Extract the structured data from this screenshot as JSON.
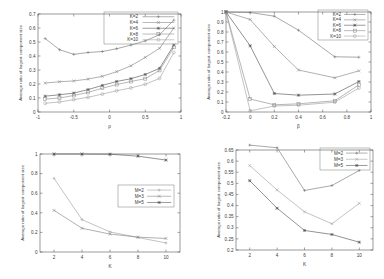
{
  "figure": {
    "background": "#ffffff",
    "panel_count": 4,
    "axis_color": "#4a4a4a"
  },
  "chart_data": [
    {
      "id": "top-left",
      "type": "line",
      "title": "",
      "xlabel": "ρ",
      "ylabel": "Average ratio of largest component size",
      "xlim": [
        -1,
        1
      ],
      "ylim": [
        0,
        0.7
      ],
      "xticks": [
        -1,
        -0.5,
        0,
        0.5,
        1
      ],
      "xticklabels": [
        "-1",
        "-0.5",
        "0",
        "0.5",
        "1"
      ],
      "yticks": [
        0,
        0.1,
        0.2,
        0.3,
        0.4,
        0.5,
        0.6,
        0.7
      ],
      "yticklabels": [
        "0",
        "0.1",
        "0.2",
        "0.3",
        "0.4",
        "0.5",
        "0.6",
        "0.7"
      ],
      "grid": false,
      "legend_position": "top-right",
      "x": [
        -0.9,
        -0.7,
        -0.5,
        -0.3,
        -0.1,
        0.1,
        0.3,
        0.5,
        0.7,
        0.9
      ],
      "series": [
        {
          "name": "K=2",
          "color": "#6f6f6f",
          "marker": "plus",
          "values": [
            0.525,
            0.445,
            0.412,
            0.425,
            0.432,
            0.452,
            0.478,
            0.508,
            0.552,
            0.657
          ]
        },
        {
          "name": "K=4",
          "color": "#7c7c7c",
          "marker": "cross",
          "values": [
            0.207,
            0.216,
            0.222,
            0.235,
            0.255,
            0.288,
            0.33,
            0.39,
            0.455,
            0.6
          ]
        },
        {
          "name": "K=6",
          "color": "#4a4a4a",
          "marker": "star",
          "values": [
            0.113,
            0.123,
            0.135,
            0.16,
            0.19,
            0.218,
            0.238,
            0.268,
            0.312,
            0.478
          ]
        },
        {
          "name": "K=8",
          "color": "#868686",
          "marker": "square",
          "values": [
            0.092,
            0.1,
            0.118,
            0.14,
            0.17,
            0.196,
            0.218,
            0.238,
            0.297,
            0.462
          ]
        },
        {
          "name": "K=10",
          "color": "#9a9a9a",
          "marker": "circle",
          "values": [
            0.062,
            0.072,
            0.088,
            0.105,
            0.128,
            0.152,
            0.172,
            0.198,
            0.24,
            0.425
          ]
        }
      ],
      "legend": [
        "K=2",
        "K=4",
        "K=6",
        "K=8",
        "K=10"
      ]
    },
    {
      "id": "top-right",
      "type": "line",
      "title": "",
      "xlabel": "β",
      "ylabel": "Average ratio of largest component size",
      "xlim": [
        -0.2,
        1
      ],
      "ylim": [
        0,
        1
      ],
      "xticks": [
        -0.2,
        0,
        0.2,
        0.4,
        0.6,
        0.8,
        1
      ],
      "xticklabels": [
        "-0.2",
        "0",
        "0.2",
        "0.4",
        "0.6",
        "0.8",
        "1"
      ],
      "yticks": [
        0,
        0.1,
        0.2,
        0.3,
        0.4,
        0.5,
        0.6,
        0.7,
        0.8,
        0.9,
        1
      ],
      "yticklabels": [
        "0",
        "0.1",
        "0.2",
        "0.3",
        "0.4",
        "0.5",
        "0.6",
        "0.7",
        "0.8",
        "0.9",
        "1"
      ],
      "grid": false,
      "legend_position": "top-right",
      "x": [
        -0.2,
        0,
        0.2,
        0.4,
        0.7,
        0.9
      ],
      "series": [
        {
          "name": "K=2",
          "color": "#6f6f6f",
          "marker": "plus",
          "values": [
            1.0,
            0.995,
            0.958,
            0.818,
            0.552,
            0.548
          ]
        },
        {
          "name": "K=4",
          "color": "#7c7c7c",
          "marker": "cross",
          "values": [
            1.0,
            0.925,
            0.655,
            0.42,
            0.342,
            0.412
          ]
        },
        {
          "name": "K=6",
          "color": "#4a4a4a",
          "marker": "star",
          "values": [
            1.0,
            0.662,
            0.185,
            0.168,
            0.18,
            0.305
          ]
        },
        {
          "name": "K=8",
          "color": "#868686",
          "marker": "square",
          "values": [
            1.0,
            0.13,
            0.072,
            0.082,
            0.112,
            0.272
          ]
        },
        {
          "name": "K=10",
          "color": "#9a9a9a",
          "marker": "circle",
          "values": [
            1.0,
            0.012,
            0.06,
            0.068,
            0.098,
            0.24
          ]
        }
      ],
      "legend": [
        "K=2",
        "K=4",
        "K=6",
        "K=8",
        "K=10"
      ]
    },
    {
      "id": "bottom-left",
      "type": "line",
      "title": "",
      "xlabel": "K",
      "ylabel": "Average ratio of largest component size",
      "xlim": [
        1,
        11
      ],
      "ylim": [
        0,
        1
      ],
      "xticks": [
        2,
        4,
        6,
        8,
        10
      ],
      "xticklabels": [
        "2",
        "4",
        "6",
        "8",
        "10"
      ],
      "yticks": [
        0,
        0.2,
        0.4,
        0.6,
        0.8,
        1
      ],
      "yticklabels": [
        "0",
        "0.2",
        "0.4",
        "0.6",
        "0.8",
        "1"
      ],
      "grid": false,
      "legend_position": "right",
      "x": [
        2,
        4,
        6,
        8,
        10
      ],
      "series": [
        {
          "name": "M=2",
          "color": "#9a9a9a",
          "marker": "plus",
          "values": [
            0.752,
            0.33,
            0.205,
            0.148,
            0.092
          ]
        },
        {
          "name": "M=3",
          "color": "#7c7c7c",
          "marker": "cross",
          "values": [
            0.425,
            0.242,
            0.183,
            0.152,
            0.138
          ]
        },
        {
          "name": "M=5",
          "color": "#4a4a4a",
          "marker": "star",
          "values": [
            1.0,
            1.0,
            0.998,
            0.978,
            0.938
          ]
        }
      ],
      "legend": [
        "M=2",
        "M=3",
        "M=5"
      ]
    },
    {
      "id": "bottom-right",
      "type": "line",
      "title": "",
      "xlabel": "K",
      "ylabel": "Average ratio of largest component size",
      "xlim": [
        1,
        11
      ],
      "ylim": [
        0.2,
        0.65
      ],
      "xticks": [
        2,
        4,
        6,
        8,
        10
      ],
      "xticklabels": [
        "2",
        "4",
        "6",
        "8",
        "10"
      ],
      "yticks": [
        0.2,
        0.25,
        0.3,
        0.35,
        0.4,
        0.45,
        0.5,
        0.55,
        0.6,
        0.65
      ],
      "yticklabels": [
        "0.2",
        "0.25",
        "0.3",
        "0.35",
        "0.4",
        "0.45",
        "0.5",
        "0.55",
        "0.6",
        "0.65"
      ],
      "grid": false,
      "legend_position": "top-right",
      "x": [
        2,
        4,
        6,
        8,
        10
      ],
      "series": [
        {
          "name": "M=2",
          "color": "#6f6f6f",
          "marker": "plus",
          "values": [
            0.672,
            0.66,
            0.468,
            0.49,
            0.558
          ]
        },
        {
          "name": "M=3",
          "color": "#9a9a9a",
          "marker": "cross",
          "values": [
            0.58,
            0.47,
            0.372,
            0.318,
            0.41
          ]
        },
        {
          "name": "M=5",
          "color": "#4a4a4a",
          "marker": "star",
          "values": [
            0.512,
            0.388,
            0.288,
            0.27,
            0.235
          ]
        }
      ],
      "legend": [
        "M=2",
        "M=3",
        "M=5"
      ]
    }
  ]
}
